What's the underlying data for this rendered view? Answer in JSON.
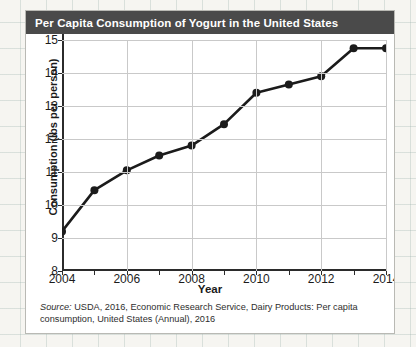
{
  "card": {
    "title": "Per Capita Consumption of Yogurt in the United States",
    "source_label": "Source:",
    "source_text": " USDA, 2016, Economic Research Service, Dairy Products: Per capita consumption, United States (Annual), 2016"
  },
  "colors": {
    "title_bar": "#4a4a4a",
    "title_text": "#ffffff",
    "card_bg": "#ffffff",
    "line": "#1b1b1b",
    "marker": "#1b1b1b",
    "grid": "#c9c9c9",
    "axis": "#2b2b2b",
    "page_bg": "#f6f5f1"
  },
  "chart_data": {
    "type": "line",
    "title": "Per Capita Consumption of Yogurt in the United States",
    "xlabel": "Year",
    "ylabel": "Consumption (lbs per person)",
    "x": [
      2004,
      2005,
      2006,
      2007,
      2008,
      2009,
      2010,
      2011,
      2012,
      2013,
      2014
    ],
    "values": [
      9.2,
      10.45,
      11.05,
      11.5,
      11.8,
      12.45,
      13.4,
      13.65,
      13.9,
      14.75,
      14.75
    ],
    "xlim": [
      2004,
      2014
    ],
    "ylim": [
      8,
      15
    ],
    "ytick_labels": [
      "15",
      "14",
      "13",
      "12",
      "11",
      "10",
      "9",
      "8"
    ],
    "yticks": [
      15,
      14,
      13,
      12,
      11,
      10,
      9,
      8
    ],
    "xtick_labels": [
      "2004",
      "2006",
      "2008",
      "2010",
      "2012",
      "2014"
    ],
    "xticks": [
      2004,
      2006,
      2008,
      2010,
      2012,
      2014
    ],
    "xtick_minor": [
      2005,
      2007,
      2009,
      2011,
      2013
    ],
    "grid": true,
    "legend": "none",
    "marker": "circle"
  }
}
